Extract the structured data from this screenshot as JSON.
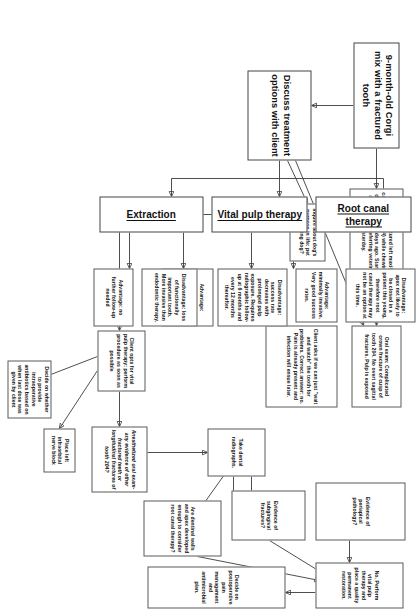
{
  "diagram": {
    "orientation": "rotated-90",
    "accent_color": "#3b3b3b",
    "border_color": "#5a5a5a",
    "background": "#ffffff"
  },
  "nodes": {
    "case_title": "9-month-old Corgi mix with a fractured tooth",
    "history": "History: Fractured left maxillary canine tooth (204) while chewing on a deer antler two days ago. Started on antibiotics by referring veterinarian yesterday.",
    "oral_exam": "Oral exam: Complicated crown fracture of cusp of tooth 204. No overt sagittal fractures. Pulp is exposed",
    "discuss_options": "Discuss treatment options with client",
    "inquire_purpose": "Inquire about dog's purpose in life: pet vs. working dog?",
    "client_asks": "Client asks if we can just \"wait and watch\" the tooth for problems. Correct answer: no. Pain is already present and infection will ensue later.",
    "stage_root_canal": "Root canal therapy",
    "stage_vital_pulp": "Vital pulp therapy",
    "stage_extraction": "Extraction",
    "rct_disadvantage": "Disadvantage: apex not likely to be closed in a patient this young, therefore root canal therapy may not be an option at this time.",
    "rct_advantage": "Advantage: minimally invasive. Very good success rates.",
    "vpt_disadvantage": "Disadvantage: success rate decreases with prolonged pulp exposure. Requires radiographic follow-up at 6 months and every 12 months thereafter.",
    "vpt_advantage": "Advantage: minimally invasive and gives the tooth a chance to maintain vitality.",
    "ext_disadvantage": "Disadvantage: loss of functionally important tooth. More invasive than endodontic therapy.",
    "ext_advantage": "Advantage: no further follow-up needed",
    "client_opts": "Client opts for vital pulp therapy: perform procedure as soon as possible",
    "anesthetized_exam": "Anesthetized oral exam- any evidence of other fractured teeth or longitudinal fractures of tooth 204?",
    "nerve_block": "Place left infraorbital nerve block",
    "intraop_abx": "Decide on whether to provide intraoperative antibiotics based on when last dose was given by client",
    "take_radiographs": "Take dental radiographs.",
    "evidence_periapical": "Evidence of periapical pathology?",
    "evidence_subgingival": "Evidence of subgingival fractures?",
    "dentinal_walls": "Are dentinal walls and apex developed enough to consider root canal therapy?",
    "perform_vpt": "No. Perform vital pulp therapy and place a quality permanent restoration.",
    "postop_plan": "Decide on postoperative pain management and antimicrobial plan."
  }
}
